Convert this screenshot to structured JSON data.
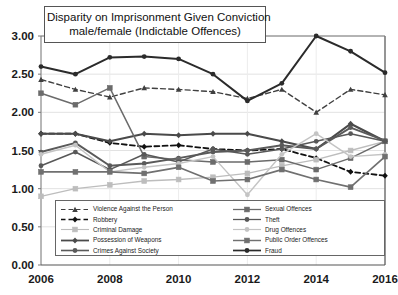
{
  "chart_data": {
    "type": "line",
    "title": "Disparity on Imprisonment Given Conviction male/female (Indictable Offences)",
    "title_lines": [
      "Disparity on Imprisonment Given Conviction",
      "male/female (Indictable Offences)"
    ],
    "xlabel": "",
    "ylabel": "",
    "x": [
      2006,
      2007,
      2008,
      2009,
      2010,
      2011,
      2012,
      2013,
      2014,
      2015,
      2016
    ],
    "xtick_labels": [
      "2006",
      "2008",
      "2010",
      "2012",
      "2014",
      "2016"
    ],
    "xtick_values": [
      2006,
      2008,
      2010,
      2012,
      2014,
      2016
    ],
    "ytick_labels": [
      "0.00",
      "0.50",
      "1.00",
      "1.50",
      "2.00",
      "2.50",
      "3.00"
    ],
    "ytick_values": [
      0,
      0.5,
      1.0,
      1.5,
      2.0,
      2.5,
      3.0
    ],
    "ylim": [
      0,
      3.0
    ],
    "xlim": [
      2006,
      2016
    ],
    "grid": true,
    "legend_position": "bottom-inside",
    "series": [
      {
        "name": "Violence Against the Person",
        "marker": "triangle",
        "dash": "dashed",
        "color": "#404040",
        "width": 1.4,
        "values": [
          2.43,
          2.3,
          2.2,
          2.32,
          2.3,
          2.27,
          2.18,
          2.3,
          2.0,
          2.3,
          2.23
        ]
      },
      {
        "name": "Robbery",
        "marker": "diamond",
        "dash": "dashed",
        "color": "#111111",
        "width": 1.8,
        "values": [
          1.72,
          1.72,
          1.6,
          1.55,
          1.57,
          1.52,
          1.5,
          1.52,
          1.4,
          1.22,
          1.17
        ]
      },
      {
        "name": "Criminal Damage",
        "marker": "square",
        "dash": "solid",
        "color": "#bdbdbd",
        "width": 1.3,
        "values": [
          0.9,
          1.0,
          1.05,
          1.1,
          1.12,
          1.15,
          1.2,
          1.3,
          1.38,
          1.5,
          1.62
        ]
      },
      {
        "name": "Possession of Weapons",
        "marker": "diamond",
        "dash": "solid",
        "color": "#4a4a4a",
        "width": 2.1,
        "values": [
          1.72,
          1.72,
          1.62,
          1.72,
          1.7,
          1.72,
          1.72,
          1.62,
          1.52,
          1.85,
          1.62
        ]
      },
      {
        "name": "Crimes Against Society",
        "marker": "circle",
        "dash": "solid",
        "color": "#5a5a5a",
        "width": 1.9,
        "values": [
          1.48,
          1.6,
          1.3,
          1.33,
          1.4,
          1.48,
          1.5,
          1.57,
          1.52,
          1.8,
          1.63
        ]
      },
      {
        "name": "Sexual Offences",
        "marker": "square",
        "dash": "solid",
        "color": "#6b6b6b",
        "width": 1.5,
        "values": [
          2.25,
          2.1,
          2.32,
          1.42,
          1.38,
          1.35,
          1.35,
          1.38,
          1.25,
          1.4,
          1.62
        ]
      },
      {
        "name": "Theft",
        "marker": "circle",
        "dash": "solid",
        "color": "#585858",
        "width": 1.5,
        "values": [
          1.3,
          1.48,
          1.25,
          1.45,
          1.35,
          1.52,
          1.45,
          1.52,
          1.62,
          1.72,
          1.62
        ]
      },
      {
        "name": "Drug Offences",
        "marker": "circle",
        "dash": "solid",
        "color": "#c4c4c4",
        "width": 1.4,
        "values": [
          1.45,
          1.57,
          1.22,
          1.28,
          1.33,
          1.42,
          0.92,
          1.45,
          1.72,
          1.42,
          1.45
        ]
      },
      {
        "name": "Public Order Offences",
        "marker": "square",
        "dash": "solid",
        "color": "#707070",
        "width": 1.7,
        "values": [
          1.22,
          1.22,
          1.22,
          1.2,
          1.28,
          1.1,
          1.12,
          1.25,
          1.12,
          1.02,
          1.42
        ]
      },
      {
        "name": "Fraud",
        "marker": "circle",
        "dash": "solid",
        "color": "#2b2b2b",
        "width": 2.0,
        "values": [
          2.6,
          2.5,
          2.72,
          2.73,
          2.7,
          2.5,
          2.15,
          2.38,
          3.0,
          2.8,
          2.52
        ]
      }
    ]
  }
}
